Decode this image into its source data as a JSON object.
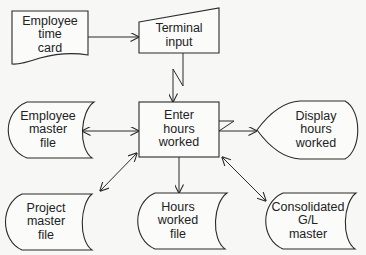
{
  "diagram": {
    "type": "system-flowchart",
    "nodes": [
      {
        "id": "employee-time-card",
        "shape": "document",
        "lines": [
          "Employee",
          "time",
          "card"
        ]
      },
      {
        "id": "terminal-input",
        "shape": "manual-input",
        "lines": [
          "Terminal",
          "input"
        ]
      },
      {
        "id": "enter-hours-worked",
        "shape": "process",
        "lines": [
          "Enter",
          "hours",
          "worked"
        ]
      },
      {
        "id": "employee-master-file",
        "shape": "stored-data",
        "lines": [
          "Employee",
          "master",
          "file"
        ]
      },
      {
        "id": "display-hours-worked",
        "shape": "display",
        "lines": [
          "Display",
          "hours",
          "worked"
        ]
      },
      {
        "id": "project-master-file",
        "shape": "stored-data",
        "lines": [
          "Project",
          "master",
          "file"
        ]
      },
      {
        "id": "hours-worked-file",
        "shape": "stored-data",
        "lines": [
          "Hours",
          "worked",
          "file"
        ]
      },
      {
        "id": "consolidated-gl-master",
        "shape": "stored-data",
        "lines": [
          "Consolidated",
          "G/L",
          "master"
        ]
      }
    ],
    "edges": [
      {
        "from": "employee-time-card",
        "to": "terminal-input",
        "direction": "one-way"
      },
      {
        "from": "terminal-input",
        "to": "enter-hours-worked",
        "direction": "one-way",
        "style": "communication-link"
      },
      {
        "from": "enter-hours-worked",
        "to": "display-hours-worked",
        "direction": "one-way",
        "style": "communication-link"
      },
      {
        "from": "employee-master-file",
        "to": "enter-hours-worked",
        "direction": "two-way"
      },
      {
        "from": "project-master-file",
        "to": "enter-hours-worked",
        "direction": "two-way"
      },
      {
        "from": "enter-hours-worked",
        "to": "hours-worked-file",
        "direction": "one-way"
      },
      {
        "from": "enter-hours-worked",
        "to": "consolidated-gl-master",
        "direction": "two-way"
      }
    ]
  },
  "labels": {
    "time_card": [
      "Employee",
      "time",
      "card"
    ],
    "terminal": [
      "Terminal",
      "input"
    ],
    "process": [
      "Enter",
      "hours",
      "worked"
    ],
    "emp_master": [
      "Employee",
      "master",
      "file"
    ],
    "display": [
      "Display",
      "hours",
      "worked"
    ],
    "project_master": [
      "Project",
      "master",
      "file"
    ],
    "hours_file": [
      "Hours",
      "worked",
      "file"
    ],
    "gl_master": [
      "Consolidated",
      "G/L",
      "master"
    ]
  }
}
